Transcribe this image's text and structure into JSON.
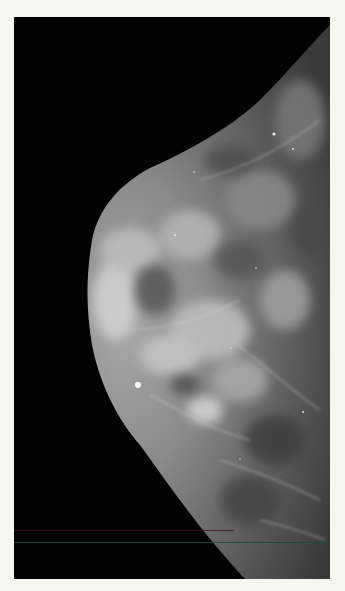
{
  "image": {
    "kind": "mammogram",
    "view": "breast tissue, lateral projection, nipple facing left",
    "background_color": "#f6f6f1",
    "film_color": "#020202",
    "artifacts": {
      "bright_marker": {
        "x": 138,
        "y": 385
      },
      "scan_lines": [
        {
          "y": 530,
          "color": "#3a1414"
        },
        {
          "y": 542,
          "color": "#1c4a36"
        }
      ]
    }
  }
}
